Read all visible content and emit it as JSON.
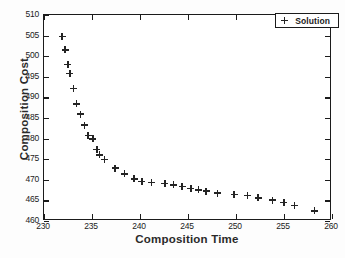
{
  "chart_data": {
    "type": "scatter",
    "title": "",
    "xlabel": "Composition Time",
    "ylabel": "Composition Cost",
    "xlim": [
      230,
      260
    ],
    "ylim": [
      460,
      510
    ],
    "xticks": [
      230,
      235,
      240,
      245,
      250,
      255,
      260
    ],
    "yticks": [
      460,
      465,
      470,
      475,
      480,
      485,
      490,
      495,
      500,
      505,
      510
    ],
    "grid": false,
    "legend": {
      "position": "top-right",
      "entries": [
        {
          "label": "Solution",
          "marker": "plus",
          "color": "#242424"
        }
      ]
    },
    "series": [
      {
        "name": "Solution",
        "marker": "plus",
        "color": "#242424",
        "points": [
          [
            232.0,
            504.5
          ],
          [
            232.3,
            501.3
          ],
          [
            232.6,
            497.8
          ],
          [
            232.8,
            495.5
          ],
          [
            233.2,
            491.9
          ],
          [
            233.5,
            488.2
          ],
          [
            233.9,
            485.7
          ],
          [
            234.3,
            483.0
          ],
          [
            234.7,
            480.5
          ],
          [
            235.2,
            479.7
          ],
          [
            235.6,
            477.1
          ],
          [
            235.9,
            475.8
          ],
          [
            236.4,
            474.7
          ],
          [
            237.5,
            472.6
          ],
          [
            238.5,
            471.2
          ],
          [
            239.5,
            470.0
          ],
          [
            240.3,
            469.4
          ],
          [
            241.3,
            469.1
          ],
          [
            242.7,
            468.8
          ],
          [
            243.6,
            468.5
          ],
          [
            244.5,
            468.1
          ],
          [
            245.4,
            467.6
          ],
          [
            246.2,
            467.3
          ],
          [
            247.0,
            467.0
          ],
          [
            248.2,
            466.5
          ],
          [
            249.9,
            466.2
          ],
          [
            251.3,
            465.9
          ],
          [
            252.4,
            465.4
          ],
          [
            253.9,
            464.8
          ],
          [
            255.1,
            464.3
          ],
          [
            256.2,
            463.5
          ],
          [
            258.3,
            462.2
          ]
        ]
      }
    ]
  },
  "axes": {
    "x_title": "Composition Time",
    "y_title": "Composition Cost"
  }
}
